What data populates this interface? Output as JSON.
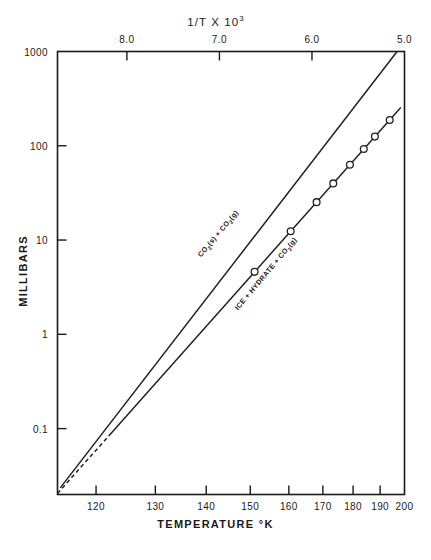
{
  "figure": {
    "type": "line-semilog",
    "top_axis_title_prefix": "1/T X 10",
    "top_axis_title_exponent": "3",
    "bottom_axis_title": "TEMPERATURE  °K",
    "y_axis_title": "MILLIBARS"
  },
  "chart_data": {
    "type": "line",
    "title": "",
    "subtitle": "",
    "xlabel": "TEMPERATURE  °K",
    "ylabel": "MILLIBARS",
    "x2label": "1/T X 10³",
    "grid": false,
    "legend_position": "inline-labels",
    "yscale": "log",
    "ylim": [
      0.02,
      1000
    ],
    "xlim_temperature_K": [
      114.3,
      200
    ],
    "x2lim_inverse_T": [
      8.75,
      5.0
    ],
    "y_tick_labels": [
      "1000",
      "100",
      "10",
      "1",
      "0.1"
    ],
    "y_tick_values": [
      1000,
      100,
      10,
      1,
      0.1
    ],
    "x_tick_labels": [
      "120",
      "130",
      "140",
      "150",
      "160",
      "170",
      "180",
      "190",
      "200"
    ],
    "x_tick_values": [
      120,
      130,
      140,
      150,
      160,
      170,
      180,
      190,
      200
    ],
    "x2_tick_labels": [
      "8.0",
      "7.0",
      "6.0",
      "5.0"
    ],
    "x2_tick_values": [
      8.0,
      7.0,
      6.0,
      5.0
    ],
    "series": [
      {
        "name": "CO₂(s) + CO₂(g)",
        "label_plain": "CO2(s) + CO2(g)",
        "style": "solid",
        "markers": "none",
        "endpoints_inverse_T": [
          8.72,
          5.08
        ],
        "endpoints_pressure_mb": [
          0.0235,
          1000.0
        ],
        "values_inverse_T": [
          8.72,
          8.0,
          7.0,
          6.0,
          5.08
        ],
        "values_pressure_mb": [
          0.0235,
          0.082,
          0.62,
          4.8,
          1000.0
        ]
      },
      {
        "name": "ICE + HYDRATE + CO₂(g)",
        "label_plain": "ICE + HYDRATE + CO2(g)",
        "style": "solid-with-dashed-extension",
        "dashed_segment": "left-of-crossover",
        "markers": "open-circle",
        "marker_count": 8,
        "data_points_inverse_T": [
          6.62,
          6.23,
          5.95,
          5.77,
          5.59,
          5.44,
          5.32,
          5.16
        ],
        "data_points_pressure_mb": [
          1.95,
          4.6,
          9.0,
          15.5,
          27.0,
          44.0,
          68.0,
          120.0
        ],
        "data_points_temperature_K": [
          151.1,
          160.5,
          168.1,
          173.3,
          178.9,
          183.8,
          188.0,
          193.8
        ],
        "endpoints_inverse_T": [
          8.75,
          5.04
        ],
        "endpoints_pressure_mb": [
          0.0205,
          255.0
        ]
      }
    ],
    "annotations": [
      {
        "text": "CO₂(s) + CO₂(g)",
        "rotation_deg": -50
      },
      {
        "text": "ICE + HYDRATE + CO₂(g)",
        "rotation_deg": -50
      }
    ]
  },
  "colors": {
    "ink": "#1a1a1a",
    "background": "#ffffff",
    "line": "#222222",
    "marker_fill": "#ffffff"
  }
}
